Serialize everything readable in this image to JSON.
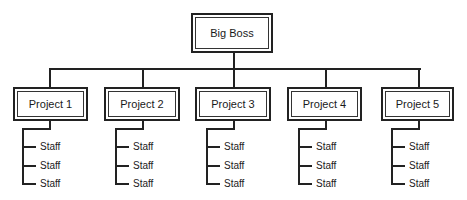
{
  "diagram": {
    "type": "org-chart",
    "root": {
      "label": "Big Boss"
    },
    "projects": [
      {
        "label": "Project 1",
        "staff": [
          "Staff",
          "Staff",
          "Staff"
        ]
      },
      {
        "label": "Project 2",
        "staff": [
          "Staff",
          "Staff",
          "Staff"
        ]
      },
      {
        "label": "Project 3",
        "staff": [
          "Staff",
          "Staff",
          "Staff"
        ]
      },
      {
        "label": "Project 4",
        "staff": [
          "Staff",
          "Staff",
          "Staff"
        ]
      },
      {
        "label": "Project 5",
        "staff": [
          "Staff",
          "Staff",
          "Staff"
        ]
      }
    ],
    "colors": {
      "line": "#222222",
      "background": "#ffffff",
      "text": "#1a1a1a"
    }
  }
}
